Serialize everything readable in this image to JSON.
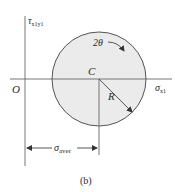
{
  "figure": {
    "caption": "(b)"
  },
  "axes": {
    "x_label": "σ",
    "x_label_sub": "x1",
    "y_label": "τ",
    "y_label_sub": "x1y1",
    "origin_label": "O"
  },
  "circle": {
    "center_label": "C",
    "radius_label": "R",
    "angle_label": "2θ",
    "center": [
      99,
      79
    ],
    "radius": 47,
    "fill_color": "#ebebeb",
    "stroke_color": "#555555"
  },
  "dimension": {
    "label": "σ",
    "label_sub": "aver"
  },
  "colors": {
    "line": "#666666",
    "text": "#2a2a2a",
    "background": "#ffffff"
  }
}
